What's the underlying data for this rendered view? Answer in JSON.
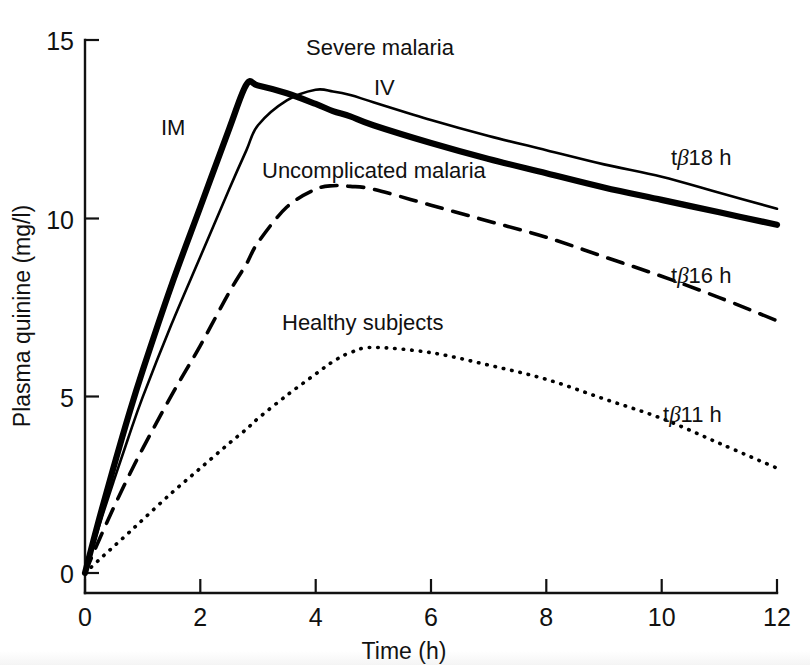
{
  "figure": {
    "background_color": "#ffffff",
    "ink_color": "#000000"
  },
  "axes": {
    "y_title": "Plasma quinine (mg/l)",
    "x_title": "Time (h)",
    "y_ticks": [
      "0",
      "5",
      "10",
      "15"
    ],
    "x_ticks": [
      "0",
      "2",
      "4",
      "6",
      "8",
      "10",
      "12"
    ]
  },
  "annotations": {
    "severe_malaria": "Severe malaria",
    "iv": "IV",
    "im": "IM",
    "uncomplicated_malaria": "Uncomplicated malaria",
    "healthy_subjects": "Healthy subjects",
    "half_life_iv_prefix": "t",
    "half_life_iv_beta": "β",
    "half_life_iv_value": "18 h",
    "half_life_uncomplicated_prefix": "t",
    "half_life_uncomplicated_beta": "β",
    "half_life_uncomplicated_value": "16 h",
    "half_life_healthy_prefix": "t",
    "half_life_healthy_beta": "β",
    "half_life_healthy_value": "11 h"
  },
  "chart_data": {
    "type": "line",
    "title": "",
    "subtitle": "",
    "xlabel": "Time (h)",
    "ylabel": "Plasma quinine (mg/l)",
    "xlim": [
      0,
      12
    ],
    "ylim": [
      0,
      15
    ],
    "xticks": [
      0,
      2,
      4,
      6,
      8,
      10,
      12
    ],
    "yticks": [
      0,
      5,
      10,
      15
    ],
    "grid": false,
    "legend_position": "inline-annotations",
    "x": [
      0,
      0.25,
      0.5,
      0.75,
      1,
      1.5,
      2,
      2.5,
      2.8,
      3,
      3.5,
      4,
      4.3,
      4.6,
      5,
      6,
      7,
      8,
      9,
      10,
      11,
      12
    ],
    "series": [
      {
        "name": "Severe malaria IM",
        "label": "IM",
        "style": "thick-solid",
        "terminal_half_life_h": 18,
        "peak": {
          "x": 2.8,
          "y": 13.75
        },
        "values": [
          0.0,
          1.55,
          3.0,
          4.4,
          5.7,
          8.1,
          10.3,
          12.5,
          13.75,
          13.72,
          13.5,
          13.2,
          13.0,
          12.85,
          12.6,
          12.1,
          11.65,
          11.25,
          10.85,
          10.5,
          10.15,
          9.8
        ]
      },
      {
        "name": "Severe malaria IV",
        "label": "IV",
        "style": "thin-solid",
        "terminal_half_life_h": 18,
        "peak": {
          "x": 4.0,
          "y": 13.6
        },
        "values": [
          0.0,
          1.35,
          2.6,
          3.8,
          4.95,
          7.0,
          8.9,
          10.8,
          11.9,
          12.6,
          13.3,
          13.6,
          13.55,
          13.45,
          13.25,
          12.75,
          12.3,
          11.9,
          11.5,
          11.15,
          10.7,
          10.25
        ]
      },
      {
        "name": "Uncomplicated malaria",
        "label": "Uncomplicated malaria",
        "style": "dashed",
        "terminal_half_life_h": 16,
        "peak": {
          "x": 4.4,
          "y": 10.9
        },
        "values": [
          0.0,
          0.95,
          1.85,
          2.7,
          3.5,
          5.0,
          6.4,
          7.9,
          8.7,
          9.3,
          10.3,
          10.8,
          10.9,
          10.88,
          10.8,
          10.35,
          9.9,
          9.45,
          8.9,
          8.35,
          7.75,
          7.1
        ]
      },
      {
        "name": "Healthy subjects",
        "label": "Healthy subjects",
        "style": "dotted",
        "terminal_half_life_h": 11,
        "peak": {
          "x": 4.6,
          "y": 6.35
        },
        "values": [
          0.0,
          0.38,
          0.75,
          1.12,
          1.5,
          2.25,
          2.95,
          3.65,
          4.05,
          4.35,
          5.0,
          5.6,
          5.95,
          6.2,
          6.35,
          6.2,
          5.85,
          5.45,
          4.9,
          4.35,
          3.65,
          2.95
        ]
      }
    ]
  }
}
